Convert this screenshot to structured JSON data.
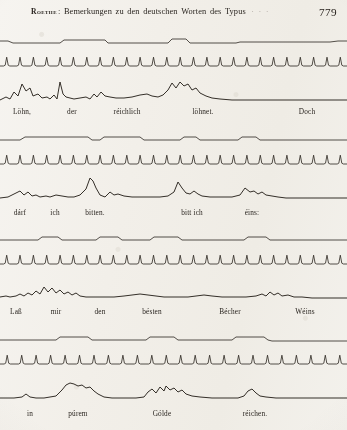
{
  "page": {
    "folio": "779",
    "running_head": {
      "author": "Roethe",
      "separator": ":",
      "title": "Bemerkungen zu den deutschen Worten des Typus",
      "title_words": [
        "Bemerkungen",
        "zu",
        "den",
        "deutschen",
        "Worten",
        "des",
        "Typus"
      ],
      "trailing_marks": "· · ·"
    }
  },
  "chart_data": {
    "type": "line",
    "trace_names": [
      "intensity-step-trace",
      "tuning-fork-time-trace",
      "speech-waveform-trace"
    ],
    "grid": false,
    "legend": false,
    "xlabel": "",
    "ylabel": "",
    "blocks": [
      {
        "index": 1,
        "words": [
          {
            "text": "Löhn,",
            "x": 22
          },
          {
            "text": "der",
            "x": 72
          },
          {
            "text": "réichlich",
            "x": 127
          },
          {
            "text": "löhnet.",
            "x": 203
          },
          {
            "text": "Doch",
            "x": 307
          }
        ],
        "step": [
          [
            0,
            11
          ],
          [
            8,
            11
          ],
          [
            13,
            13
          ],
          [
            22,
            13
          ],
          [
            60,
            13
          ],
          [
            64,
            10
          ],
          [
            78,
            10
          ],
          [
            105,
            10
          ],
          [
            108,
            13
          ],
          [
            112,
            13
          ],
          [
            168,
            13
          ],
          [
            172,
            9
          ],
          [
            186,
            9
          ],
          [
            190,
            13
          ],
          [
            236,
            13
          ],
          [
            240,
            12
          ],
          [
            330,
            12
          ],
          [
            338,
            11
          ],
          [
            347,
            11
          ]
        ],
        "fork_ticks": 26,
        "wave": [
          [
            0,
            30
          ],
          [
            6,
            27
          ],
          [
            10,
            29
          ],
          [
            14,
            22
          ],
          [
            18,
            26
          ],
          [
            22,
            14
          ],
          [
            26,
            21
          ],
          [
            30,
            18
          ],
          [
            33,
            26
          ],
          [
            38,
            24
          ],
          [
            42,
            28
          ],
          [
            47,
            27
          ],
          [
            50,
            29
          ],
          [
            54,
            25
          ],
          [
            57,
            29
          ],
          [
            60,
            12
          ],
          [
            63,
            24
          ],
          [
            66,
            27
          ],
          [
            70,
            28
          ],
          [
            74,
            29
          ],
          [
            80,
            28
          ],
          [
            86,
            27
          ],
          [
            90,
            29
          ],
          [
            94,
            24
          ],
          [
            97,
            27
          ],
          [
            101,
            22
          ],
          [
            105,
            26
          ],
          [
            110,
            27
          ],
          [
            116,
            28
          ],
          [
            124,
            28
          ],
          [
            132,
            27
          ],
          [
            140,
            25
          ],
          [
            147,
            24
          ],
          [
            152,
            26
          ],
          [
            158,
            27
          ],
          [
            163,
            25
          ],
          [
            168,
            20
          ],
          [
            172,
            13
          ],
          [
            176,
            18
          ],
          [
            180,
            12
          ],
          [
            184,
            16
          ],
          [
            188,
            14
          ],
          [
            192,
            20
          ],
          [
            196,
            18
          ],
          [
            200,
            23
          ],
          [
            206,
            26
          ],
          [
            212,
            28
          ],
          [
            220,
            29
          ],
          [
            232,
            30
          ],
          [
            250,
            30
          ],
          [
            300,
            30
          ],
          [
            347,
            30
          ]
        ]
      },
      {
        "index": 2,
        "words": [
          {
            "text": "dárf",
            "x": 20
          },
          {
            "text": "ich",
            "x": 55
          },
          {
            "text": "bitten.",
            "x": 95
          },
          {
            "text": "bitt ich",
            "x": 192
          },
          {
            "text": "éins:",
            "x": 252
          }
        ],
        "step": [
          [
            0,
            12
          ],
          [
            20,
            12
          ],
          [
            25,
            9
          ],
          [
            88,
            9
          ],
          [
            92,
            12
          ],
          [
            100,
            12
          ],
          [
            104,
            9
          ],
          [
            140,
            9
          ],
          [
            144,
            12
          ],
          [
            180,
            12
          ],
          [
            184,
            9
          ],
          [
            196,
            9
          ],
          [
            200,
            12
          ],
          [
            238,
            12
          ],
          [
            242,
            9
          ],
          [
            256,
            9
          ],
          [
            260,
            12
          ],
          [
            347,
            12
          ]
        ],
        "fork_ticks": 26,
        "wave": [
          [
            0,
            30
          ],
          [
            8,
            29
          ],
          [
            14,
            26
          ],
          [
            20,
            23
          ],
          [
            24,
            27
          ],
          [
            28,
            24
          ],
          [
            32,
            28
          ],
          [
            36,
            27
          ],
          [
            40,
            29
          ],
          [
            46,
            28
          ],
          [
            50,
            29
          ],
          [
            56,
            27
          ],
          [
            62,
            28
          ],
          [
            68,
            29
          ],
          [
            74,
            29
          ],
          [
            80,
            27
          ],
          [
            86,
            21
          ],
          [
            90,
            10
          ],
          [
            93,
            13
          ],
          [
            96,
            20
          ],
          [
            100,
            27
          ],
          [
            105,
            29
          ],
          [
            110,
            24
          ],
          [
            114,
            27
          ],
          [
            118,
            26
          ],
          [
            124,
            28
          ],
          [
            132,
            29
          ],
          [
            142,
            29
          ],
          [
            152,
            29
          ],
          [
            160,
            29
          ],
          [
            168,
            28
          ],
          [
            174,
            24
          ],
          [
            178,
            14
          ],
          [
            182,
            20
          ],
          [
            186,
            25
          ],
          [
            190,
            26
          ],
          [
            194,
            23
          ],
          [
            198,
            26
          ],
          [
            202,
            28
          ],
          [
            210,
            29
          ],
          [
            220,
            29
          ],
          [
            232,
            29
          ],
          [
            240,
            27
          ],
          [
            245,
            20
          ],
          [
            250,
            24
          ],
          [
            254,
            23
          ],
          [
            258,
            26
          ],
          [
            262,
            24
          ],
          [
            266,
            27
          ],
          [
            272,
            28
          ],
          [
            278,
            29
          ],
          [
            286,
            30
          ],
          [
            300,
            30
          ],
          [
            347,
            30
          ]
        ]
      },
      {
        "index": 3,
        "words": [
          {
            "text": "Laß",
            "x": 16
          },
          {
            "text": "mir",
            "x": 56
          },
          {
            "text": "den",
            "x": 100
          },
          {
            "text": "bésten",
            "x": 152
          },
          {
            "text": "Bécher",
            "x": 230
          },
          {
            "text": "Wéins",
            "x": 305
          }
        ],
        "step": [
          [
            0,
            12
          ],
          [
            38,
            12
          ],
          [
            42,
            9
          ],
          [
            58,
            9
          ],
          [
            62,
            12
          ],
          [
            96,
            12
          ],
          [
            100,
            9
          ],
          [
            118,
            9
          ],
          [
            122,
            12
          ],
          [
            150,
            12
          ],
          [
            154,
            9
          ],
          [
            178,
            9
          ],
          [
            182,
            12
          ],
          [
            244,
            12
          ],
          [
            248,
            9
          ],
          [
            266,
            9
          ],
          [
            270,
            12
          ],
          [
            347,
            12
          ]
        ],
        "fork_ticks": 26,
        "wave": [
          [
            0,
            29
          ],
          [
            6,
            28
          ],
          [
            10,
            29
          ],
          [
            16,
            28
          ],
          [
            20,
            26
          ],
          [
            24,
            28
          ],
          [
            28,
            25
          ],
          [
            32,
            27
          ],
          [
            36,
            23
          ],
          [
            40,
            26
          ],
          [
            44,
            19
          ],
          [
            48,
            24
          ],
          [
            52,
            20
          ],
          [
            56,
            25
          ],
          [
            60,
            22
          ],
          [
            64,
            26
          ],
          [
            68,
            24
          ],
          [
            72,
            27
          ],
          [
            76,
            25
          ],
          [
            80,
            28
          ],
          [
            86,
            29
          ],
          [
            94,
            29
          ],
          [
            104,
            29
          ],
          [
            114,
            29
          ],
          [
            124,
            28
          ],
          [
            132,
            27
          ],
          [
            140,
            26
          ],
          [
            148,
            27
          ],
          [
            156,
            28
          ],
          [
            164,
            29
          ],
          [
            176,
            29
          ],
          [
            188,
            29
          ],
          [
            196,
            28
          ],
          [
            204,
            27
          ],
          [
            212,
            28
          ],
          [
            222,
            29
          ],
          [
            234,
            29
          ],
          [
            246,
            29
          ],
          [
            256,
            28
          ],
          [
            262,
            26
          ],
          [
            266,
            28
          ],
          [
            270,
            24
          ],
          [
            274,
            27
          ],
          [
            278,
            25
          ],
          [
            282,
            28
          ],
          [
            288,
            27
          ],
          [
            294,
            29
          ],
          [
            302,
            29
          ],
          [
            312,
            30
          ],
          [
            330,
            30
          ],
          [
            347,
            30
          ]
        ]
      },
      {
        "index": 4,
        "words": [
          {
            "text": "in",
            "x": 30
          },
          {
            "text": "púrem",
            "x": 78
          },
          {
            "text": "Gólde",
            "x": 162
          },
          {
            "text": "réichen.",
            "x": 255
          }
        ],
        "step": [
          [
            0,
            12
          ],
          [
            56,
            12
          ],
          [
            60,
            9
          ],
          [
            88,
            9
          ],
          [
            92,
            12
          ],
          [
            146,
            12
          ],
          [
            150,
            9
          ],
          [
            174,
            9
          ],
          [
            178,
            12
          ],
          [
            232,
            12
          ],
          [
            236,
            9
          ],
          [
            264,
            9
          ],
          [
            268,
            12
          ],
          [
            272,
            13
          ],
          [
            347,
            13
          ]
        ],
        "fork_ticks": 24,
        "wave": [
          [
            0,
            30
          ],
          [
            14,
            30
          ],
          [
            22,
            29
          ],
          [
            26,
            26
          ],
          [
            30,
            29
          ],
          [
            36,
            30
          ],
          [
            44,
            30
          ],
          [
            50,
            29
          ],
          [
            56,
            28
          ],
          [
            62,
            22
          ],
          [
            66,
            17
          ],
          [
            70,
            15
          ],
          [
            74,
            16
          ],
          [
            78,
            18
          ],
          [
            82,
            17
          ],
          [
            86,
            20
          ],
          [
            90,
            19
          ],
          [
            94,
            23
          ],
          [
            98,
            26
          ],
          [
            104,
            29
          ],
          [
            112,
            30
          ],
          [
            124,
            30
          ],
          [
            136,
            30
          ],
          [
            144,
            29
          ],
          [
            148,
            24
          ],
          [
            152,
            21
          ],
          [
            156,
            25
          ],
          [
            160,
            19
          ],
          [
            164,
            23
          ],
          [
            166,
            18
          ],
          [
            170,
            22
          ],
          [
            174,
            20
          ],
          [
            178,
            24
          ],
          [
            182,
            22
          ],
          [
            186,
            26
          ],
          [
            192,
            28
          ],
          [
            200,
            29
          ],
          [
            212,
            30
          ],
          [
            226,
            30
          ],
          [
            238,
            30
          ],
          [
            244,
            28
          ],
          [
            248,
            23
          ],
          [
            252,
            21
          ],
          [
            256,
            25
          ],
          [
            260,
            28
          ],
          [
            266,
            29
          ],
          [
            276,
            30
          ],
          [
            300,
            30
          ],
          [
            347,
            30
          ]
        ]
      }
    ]
  }
}
